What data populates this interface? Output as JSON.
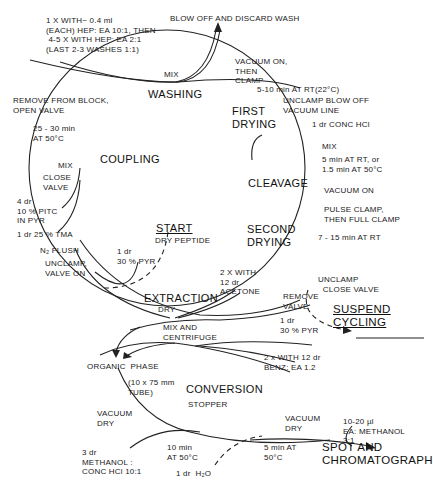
{
  "stages": {
    "washing": "WASHING",
    "first_drying": "FIRST\nDRYING",
    "cleavage": "CLEAVAGE",
    "second_drying": "SECOND\nDRYING",
    "extraction": "EXTRACTION",
    "coupling": "COUPLING",
    "start": "START",
    "start_sub": "DRY PEPTIDE",
    "conversion": "CONVERSION",
    "suspend": "SUSPEND\nCYCLING",
    "spot": "SPOT AND\nCHROMATOGRAPH",
    "organic_phase": "ORGANIC  PHASE"
  },
  "annotations": {
    "wash_reagent": "1 X WITH~ 0.4 ml\n(EACH) HEP: EA 10:1, THEN\n 4-5 X WITH HEP: EA 2:1\n(LAST 2-3 WASHES 1:1)",
    "blow_off": "BLOW OFF AND DISCARD WASH",
    "wash_mix": "MIX",
    "vacuum_on_clamp": "VACUUM ON,\nTHEN\nCLAMP",
    "first_dry_time": "5-10 min AT RT(22°C)",
    "unclamp_blow": "UNCLAMP BLOW OFF\nVACUUM LINE",
    "conc_hcl": "1 dr CONC HCl",
    "cleavage_mix": "MIX",
    "cleavage_time": "5 min AT RT, or\n1.5 min AT 50°C",
    "vacuum_on": "VACUUM ON",
    "pulse_clamp": "PULSE CLAMP,\nTHEN FULL CLAMP",
    "second_dry_time": "7 - 15 min AT RT",
    "unclamp_close": "UNCLAMP\n  CLOSE VALVE",
    "remove_valve": "REMOVE\nVALVE",
    "acetone": "2 X WITH\n12 dr\nACETONE",
    "pyr_right": "1 dr\n30 % PYR",
    "benz": "2 x WITH 12 dr\nBENZ: EA 1.2",
    "mix_centrifuge": "MIX AND\nCENTRIFUGE",
    "extraction_dry": "DRY",
    "remove_block": "REMOVE FROM BLOCK,\nOPEN VALVE",
    "coupling_time": "25 - 30 min\nAT 50°C",
    "coupling_mix": "MIX",
    "close_valve": "CLOSE\nVALVE",
    "pitc": "4 dr\n10 % PITC\nIN PYR",
    "tma": "1 dr 25 % TMA",
    "n2_flush": "N₂ FLUSH",
    "unclamp_valve_on": "UNCLAMP,\nVALVE ON",
    "pyr_left": "1 dr\n30 % PYR",
    "tube": "(10 x 75 mm\nTUBE)",
    "vacuum_dry_left": "VACUUM\nDRY",
    "methanol_hcl": "3 dr\nMETHANOL :\nCONC HCl 10:1",
    "stopper": "STOPPER",
    "conv_time1": "10 min\nAT 50°C",
    "water": "1 dr  H₂O",
    "conv_time2": "5 min AT\n50°C",
    "vacuum_dry_right": "VACUUM\nDRY",
    "ea_methanol": "10-20 µl\nEA: METHANOL\n3:1"
  }
}
